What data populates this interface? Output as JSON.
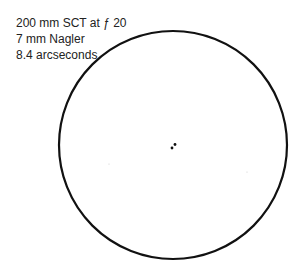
{
  "labels": {
    "telescope": "200 mm SCT at ƒ 20",
    "eyepiece": "7 mm Nagler",
    "separation": "8.4 arcseconds"
  },
  "field": {
    "center": [
      173,
      145
    ],
    "radius": 114,
    "stroke_color": "#111111"
  },
  "stars": [
    {
      "x": 172,
      "y": 148,
      "r": 1.4,
      "color": "#111111"
    },
    {
      "x": 175,
      "y": 144.5,
      "r": 1.4,
      "color": "#111111"
    },
    {
      "x": 109,
      "y": 164,
      "r": 0.6,
      "color": "#cccccc"
    },
    {
      "x": 247,
      "y": 172,
      "r": 0.6,
      "color": "#cccccc"
    }
  ]
}
